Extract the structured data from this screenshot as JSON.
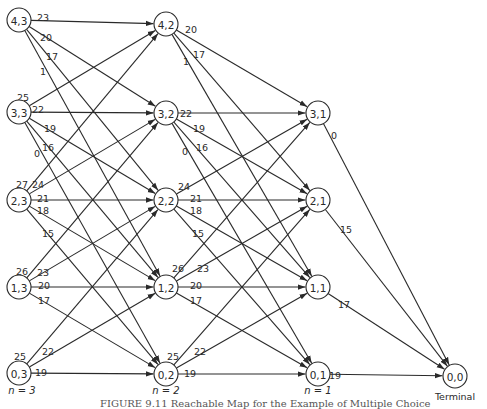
{
  "figure": {
    "caption": "FIGURE 9.11  Reachable Map for the Example of Multiple Choice"
  },
  "stages": [
    {
      "label": "n = 3",
      "x": 22,
      "y": 394
    },
    {
      "label": "n = 2",
      "x": 166,
      "y": 394
    },
    {
      "label": "n = 1",
      "x": 318,
      "y": 394
    }
  ],
  "terminal_label": "Terminal",
  "nodes": [
    {
      "id": "4,3",
      "x": 19,
      "y": 20
    },
    {
      "id": "3,3",
      "x": 19,
      "y": 112
    },
    {
      "id": "2,3",
      "x": 19,
      "y": 200
    },
    {
      "id": "1,3",
      "x": 19,
      "y": 287
    },
    {
      "id": "0,3",
      "x": 19,
      "y": 373
    },
    {
      "id": "4,2",
      "x": 166,
      "y": 24
    },
    {
      "id": "3,2",
      "x": 166,
      "y": 113
    },
    {
      "id": "2,2",
      "x": 166,
      "y": 200
    },
    {
      "id": "1,2",
      "x": 166,
      "y": 287
    },
    {
      "id": "0,2",
      "x": 166,
      "y": 374
    },
    {
      "id": "3,1",
      "x": 318,
      "y": 113
    },
    {
      "id": "2,1",
      "x": 318,
      "y": 200
    },
    {
      "id": "1,1",
      "x": 318,
      "y": 287
    },
    {
      "id": "0,1",
      "x": 318,
      "y": 374
    },
    {
      "id": "0,0",
      "x": 455,
      "y": 376
    }
  ],
  "edges": [
    {
      "from": "4,3",
      "to": "4,2",
      "label": "23",
      "lx": 37,
      "ly": 13
    },
    {
      "from": "4,3",
      "to": "3,2",
      "label": "20",
      "lx": 40,
      "ly": 33
    },
    {
      "from": "4,3",
      "to": "2,2",
      "label": "17",
      "lx": 46,
      "ly": 52
    },
    {
      "from": "4,3",
      "to": "1,2",
      "label": "1",
      "lx": 40,
      "ly": 67
    },
    {
      "from": "3,3",
      "to": "4,2",
      "label": "25",
      "lx": 17,
      "ly": 93
    },
    {
      "from": "3,3",
      "to": "3,2",
      "label": "22",
      "lx": 32,
      "ly": 105
    },
    {
      "from": "3,3",
      "to": "2,2",
      "label": "19",
      "lx": 44,
      "ly": 124
    },
    {
      "from": "3,3",
      "to": "1,2",
      "label": "16",
      "lx": 42,
      "ly": 143
    },
    {
      "from": "3,3",
      "to": "0,2",
      "label": "0",
      "lx": 34,
      "ly": 149
    },
    {
      "from": "2,3",
      "to": "4,2",
      "label": "27",
      "lx": 16,
      "ly": 180
    },
    {
      "from": "2,3",
      "to": "3,2",
      "label": "24",
      "lx": 32,
      "ly": 180
    },
    {
      "from": "2,3",
      "to": "2,2",
      "label": "21",
      "lx": 37,
      "ly": 194
    },
    {
      "from": "2,3",
      "to": "1,2",
      "label": "18",
      "lx": 37,
      "ly": 206
    },
    {
      "from": "2,3",
      "to": "0,2",
      "label": "15",
      "lx": 42,
      "ly": 229
    },
    {
      "from": "1,3",
      "to": "3,2",
      "label": "26",
      "lx": 16,
      "ly": 267
    },
    {
      "from": "1,3",
      "to": "2,2",
      "label": "23",
      "lx": 37,
      "ly": 268
    },
    {
      "from": "1,3",
      "to": "1,2",
      "label": "20",
      "lx": 38,
      "ly": 281
    },
    {
      "from": "1,3",
      "to": "0,2",
      "label": "17",
      "lx": 38,
      "ly": 296
    },
    {
      "from": "0,3",
      "to": "2,2",
      "label": "25",
      "lx": 14,
      "ly": 352
    },
    {
      "from": "0,3",
      "to": "1,2",
      "label": "22",
      "lx": 42,
      "ly": 347
    },
    {
      "from": "0,3",
      "to": "0,2",
      "label": "19",
      "lx": 35,
      "ly": 368
    },
    {
      "from": "4,2",
      "to": "3,1",
      "label": "20",
      "lx": 185,
      "ly": 25
    },
    {
      "from": "4,2",
      "to": "2,1",
      "label": "17",
      "lx": 193,
      "ly": 50
    },
    {
      "from": "4,2",
      "to": "1,1",
      "label": "1",
      "lx": 183,
      "ly": 57
    },
    {
      "from": "3,2",
      "to": "3,1",
      "label": "22",
      "lx": 180,
      "ly": 109
    },
    {
      "from": "3,2",
      "to": "2,1",
      "label": "19",
      "lx": 193,
      "ly": 124
    },
    {
      "from": "3,2",
      "to": "1,1",
      "label": "16",
      "lx": 196,
      "ly": 143
    },
    {
      "from": "3,2",
      "to": "0,1",
      "label": "0",
      "lx": 182,
      "ly": 147
    },
    {
      "from": "2,2",
      "to": "3,1",
      "label": "24",
      "lx": 178,
      "ly": 182
    },
    {
      "from": "2,2",
      "to": "2,1",
      "label": "21",
      "lx": 190,
      "ly": 194
    },
    {
      "from": "2,2",
      "to": "1,1",
      "label": "18",
      "lx": 190,
      "ly": 206
    },
    {
      "from": "2,2",
      "to": "0,1",
      "label": "15",
      "lx": 192,
      "ly": 229
    },
    {
      "from": "1,2",
      "to": "3,1",
      "label": "26",
      "lx": 172,
      "ly": 264
    },
    {
      "from": "1,2",
      "to": "2,1",
      "label": "23",
      "lx": 197,
      "ly": 264
    },
    {
      "from": "1,2",
      "to": "1,1",
      "label": "20",
      "lx": 190,
      "ly": 281
    },
    {
      "from": "1,2",
      "to": "0,1",
      "label": "17",
      "lx": 190,
      "ly": 296
    },
    {
      "from": "0,2",
      "to": "2,1",
      "label": "25",
      "lx": 167,
      "ly": 352
    },
    {
      "from": "0,2",
      "to": "1,1",
      "label": "22",
      "lx": 194,
      "ly": 347
    },
    {
      "from": "0,2",
      "to": "0,1",
      "label": "19",
      "lx": 184,
      "ly": 369
    },
    {
      "from": "3,1",
      "to": "0,0",
      "label": "0",
      "lx": 331,
      "ly": 131
    },
    {
      "from": "2,1",
      "to": "0,0",
      "label": "15",
      "lx": 340,
      "ly": 225
    },
    {
      "from": "1,1",
      "to": "0,0",
      "label": "17",
      "lx": 338,
      "ly": 300
    },
    {
      "from": "0,1",
      "to": "0,0",
      "label": "19",
      "lx": 329,
      "ly": 371
    }
  ],
  "node_radius": 12
}
